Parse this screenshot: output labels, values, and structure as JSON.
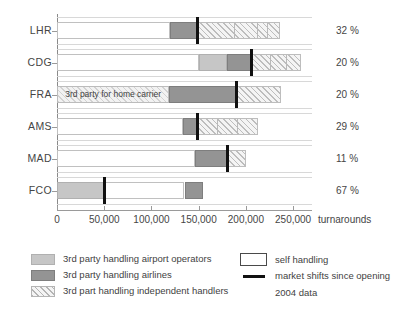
{
  "chart_data": {
    "type": "bar",
    "title": "",
    "subtitle": "",
    "xlabel": "turnarounds",
    "ylabel": "",
    "xlim": [
      0,
      270000
    ],
    "grid": false,
    "orientation": "horizontal",
    "stacked": true,
    "legend_position": "bottom",
    "categories": [
      "LHR",
      "CDG",
      "FRA",
      "AMS",
      "MAD",
      "FCO"
    ],
    "xticks": [
      0,
      50000,
      100000,
      150000,
      200000,
      250000
    ],
    "xticklabels": [
      "0",
      "50,000",
      "100,000",
      "150,000",
      "200,000",
      "250,000"
    ],
    "series": [
      {
        "name": "self handling",
        "key": "self",
        "values": [
          120000,
          150000,
          0,
          133000,
          146000,
          85000
        ]
      },
      {
        "name": "3rd party handling airport operators",
        "key": "airport",
        "values": [
          0,
          30000,
          0,
          0,
          0,
          50000
        ]
      },
      {
        "name": "3rd party handling airlines",
        "key": "airlines",
        "values": [
          28000,
          25000,
          71000,
          15000,
          34000,
          20000
        ]
      },
      {
        "name": "3rd part handling independent handlers",
        "key": "indep",
        "values": [
          88000,
          53000,
          47000,
          65000,
          20000,
          0
        ]
      }
    ],
    "markers": {
      "name": "market shifts since opening",
      "values": [
        148000,
        205000,
        190000,
        148000,
        180000,
        50000
      ]
    },
    "right_labels": {
      "header": "",
      "values": [
        "32 %",
        "20 %",
        "20 %",
        "29 %",
        "11 %",
        "67 %"
      ]
    },
    "annotations": [
      {
        "text": "3rd party for home carrier",
        "category": "FRA",
        "x_start": 0,
        "x_end": 119000
      }
    ],
    "note": "2004 data"
  },
  "legend": {
    "items_left": [
      {
        "label": "3rd party handling airport operators",
        "swatch": "airport"
      },
      {
        "label": "3rd party handling airlines",
        "swatch": "airlines"
      },
      {
        "label": "3rd part handling independent handlers",
        "swatch": "indep"
      }
    ],
    "items_right": [
      {
        "label": "self handling",
        "swatch": "self"
      },
      {
        "label": "market shifts since opening",
        "swatch": "line"
      },
      {
        "label": "2004 data",
        "swatch": "none"
      }
    ]
  },
  "colors": {
    "airport_operators": "#c6c6c6",
    "airlines": "#949494",
    "independent": "#f4f4f4",
    "self_handling": "#ffffff",
    "marker": "#111111",
    "axis": "#8a8a8a",
    "text": "#3f3f3f"
  }
}
